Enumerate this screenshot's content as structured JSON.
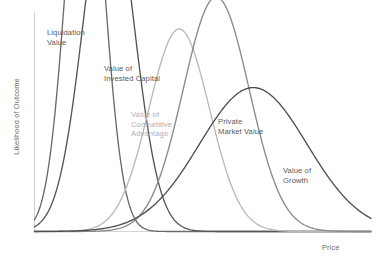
{
  "chart_data": {
    "type": "line",
    "title": "",
    "subtitle": "",
    "xlabel": "Price",
    "ylabel": "Likelihood of Outcome",
    "xlim": [
      0,
      100
    ],
    "ylim": [
      0,
      100
    ],
    "grid": false,
    "legend_position": "inline-annotations",
    "xticklabels": [],
    "yticklabels": [],
    "annotations": [
      "Liquidation Value",
      "Value of Invested Capital",
      "Value of Competitive Advantage",
      "Private Market Value",
      "Value of Growth"
    ],
    "series": [
      {
        "name": "Liquidation Value",
        "label_lines": [
          "Liquidation",
          "Value"
        ],
        "color": "#6a6a6a",
        "peak_x": 15,
        "peak_y": 79,
        "width": 5.6,
        "x": [
          5,
          7,
          9,
          11,
          13,
          15,
          17,
          19,
          21,
          23,
          25,
          27,
          30,
          35,
          40
        ],
        "values": [
          1,
          4,
          16,
          45,
          72,
          79,
          70,
          44,
          20,
          8,
          3,
          1.2,
          0.4,
          0.1,
          0
        ]
      },
      {
        "name": "Value of Invested Capital",
        "label_lines": [
          "Value of",
          "Invested Capital"
        ],
        "color": "#555555",
        "peak_x": 22,
        "peak_y": 65,
        "width": 7.5,
        "x": [
          8,
          11,
          14,
          17,
          20,
          22,
          25,
          28,
          31,
          34,
          37,
          40,
          44,
          48,
          52
        ],
        "values": [
          0.5,
          3,
          12,
          34,
          57,
          65,
          59,
          40,
          22,
          10,
          4,
          1.6,
          0.5,
          0.1,
          0
        ]
      },
      {
        "name": "Value of Competitive Advantage",
        "label_lines": [
          "Value of",
          "Competitive",
          "Advantage"
        ],
        "color": "#b9b9b9",
        "peak_x": 43,
        "peak_y": 38,
        "width": 9.0,
        "x": [
          22,
          26,
          30,
          34,
          38,
          43,
          47,
          51,
          55,
          60,
          65,
          70,
          76,
          82,
          90
        ],
        "values": [
          0.5,
          2,
          7,
          17,
          30,
          38,
          35,
          26,
          16,
          8,
          3.5,
          1.4,
          0.5,
          0.15,
          0
        ]
      },
      {
        "name": "Private Market Value",
        "label_lines": [
          "Private",
          "Market Value"
        ],
        "color": "#8a8a8a",
        "peak_x": 54,
        "peak_y": 44,
        "width": 9.8,
        "x": [
          30,
          34,
          38,
          42,
          46,
          50,
          54,
          58,
          62,
          67,
          72,
          78,
          84,
          90,
          96
        ],
        "values": [
          0.4,
          1.6,
          5,
          13,
          25,
          37,
          44,
          41,
          31,
          18,
          9,
          3.5,
          1.2,
          0.3,
          0
        ],
        "note": "left tail descends steeply to baseline near x=34"
      },
      {
        "name": "Value of Growth",
        "label_lines": [
          "Value of",
          "Growth"
        ],
        "color": "#4f4f4f",
        "peak_x": 65,
        "peak_y": 27,
        "width": 16.0,
        "x": [
          32,
          38,
          44,
          50,
          56,
          62,
          65,
          70,
          76,
          82,
          88,
          93,
          97,
          99,
          100
        ],
        "values": [
          0.5,
          2,
          5.5,
          11,
          18,
          25,
          27,
          25,
          19,
          12,
          6.5,
          3,
          1.2,
          0.4,
          0
        ]
      }
    ]
  },
  "axes": {
    "y_axis_label": "Likelihood of Outcome",
    "x_axis_label": "Price",
    "axis_color": "#d4d4d4"
  },
  "labels": {
    "liquidation": "Liquidation\nValue",
    "invested": "Value of\nInvested Capital",
    "competitive": "Value of\nCompetitive\nAdvantage",
    "private": "Private\nMarket Value",
    "growth": "Value of\nGrowth"
  }
}
